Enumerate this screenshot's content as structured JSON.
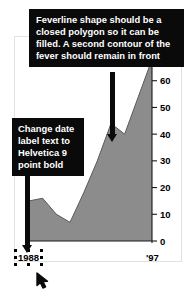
{
  "document": {
    "title": "Fever chart markup with editorial callouts"
  },
  "callouts": [
    {
      "id": "feverline-note",
      "text": "Feverline shape should be a closed polygon so it can be filled. A second contour of the fever should remain in front",
      "background": "#0a0a0a",
      "color": "#ffffff"
    },
    {
      "id": "date-label-note",
      "text": "Change date label text to Helvetica 9 point bold",
      "background": "#0a0a0a",
      "color": "#ffffff"
    }
  ],
  "selection": {
    "target_label": "1988",
    "handle_count": 8,
    "handle_color": "#000000"
  },
  "chart_data": {
    "type": "area",
    "title": "",
    "subtitle": "",
    "xlabel": "",
    "ylabel": "",
    "categories": [
      "1988",
      "1989",
      "1990",
      "1991",
      "1992",
      "1993",
      "1994",
      "1995",
      "1996",
      "'97"
    ],
    "x_tick_labels": [
      "1988",
      "'97"
    ],
    "values": [
      15,
      16,
      10,
      7,
      18,
      30,
      44,
      40,
      54,
      68
    ],
    "ylim": [
      0,
      70
    ],
    "y_ticks": [
      0,
      10,
      20,
      30,
      40,
      50,
      60,
      70
    ],
    "y_tick_labels": [
      "0",
      "10",
      "20",
      "30",
      "40",
      "50",
      "60",
      "70"
    ],
    "grid": true,
    "grid_color": "#4a4a4a",
    "fill_color": "#8c8c8c",
    "line_color": "#5a5a5a",
    "axis_color": "#1a1a1a",
    "legend": "none"
  }
}
